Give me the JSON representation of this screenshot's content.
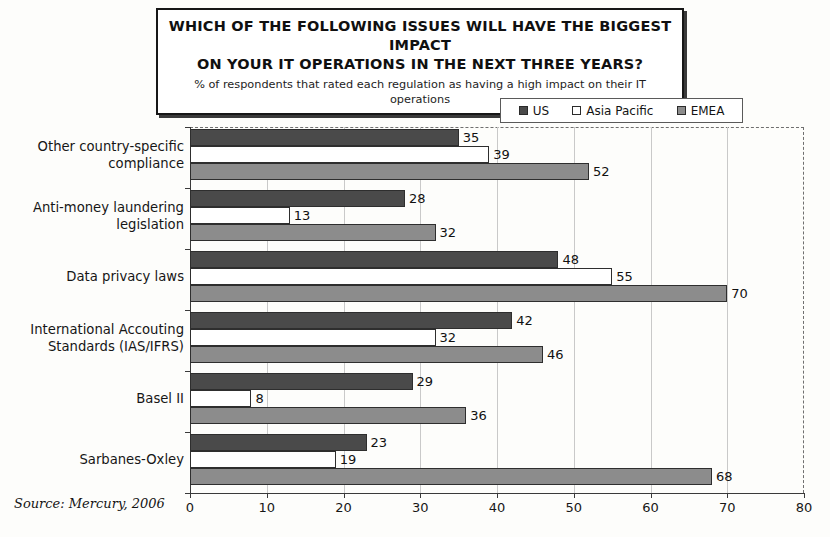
{
  "title": {
    "line1": "WHICH OF THE FOLLOWING ISSUES WILL HAVE THE BIGGEST IMPACT",
    "line2": "ON YOUR IT OPERATIONS IN THE NEXT THREE YEARS?",
    "subtitle": "% of respondents that rated each regulation as having a high impact on their IT operations"
  },
  "source": "Source: Mercury, 2006",
  "colors": {
    "us": "#4a4a4a",
    "asia_pacific": "#ffffff",
    "emea": "#8c8c8c",
    "grid": "#c9c9c9",
    "axis": "#3a3a3a",
    "frame_dashed": "#6f6f6f"
  },
  "chart_data": {
    "type": "bar",
    "orientation": "horizontal",
    "title": "WHICH OF THE FOLLOWING ISSUES WILL HAVE THE BIGGEST IMPACT ON YOUR IT OPERATIONS IN THE NEXT THREE YEARS?",
    "subtitle": "% of respondents that rated each regulation as having a high impact on their IT operations",
    "xlabel": "",
    "ylabel": "",
    "xlim": [
      0,
      80
    ],
    "xticks": [
      0,
      10,
      20,
      30,
      40,
      50,
      60,
      70,
      80
    ],
    "grid": true,
    "legend_position": "top-right",
    "categories": [
      "Other country-specific compliance",
      "Anti-money laundering legislation",
      "Data privacy laws",
      "International Accouting Standards (IAS/IFRS)",
      "Basel II",
      "Sarbanes-Oxley"
    ],
    "category_lines": [
      [
        "Other country-specific",
        "compliance"
      ],
      [
        "Anti-money laundering",
        "legislation"
      ],
      [
        "Data privacy laws"
      ],
      [
        "International Accouting",
        "Standards (IAS/IFRS)"
      ],
      [
        "Basel II"
      ],
      [
        "Sarbanes-Oxley"
      ]
    ],
    "series": [
      {
        "name": "US",
        "color": "#4a4a4a",
        "values": [
          35,
          28,
          48,
          42,
          29,
          23
        ]
      },
      {
        "name": "Asia Pacific",
        "color": "#ffffff",
        "values": [
          39,
          13,
          55,
          32,
          8,
          19
        ]
      },
      {
        "name": "EMEA",
        "color": "#8c8c8c",
        "values": [
          52,
          32,
          70,
          46,
          36,
          68
        ]
      }
    ]
  },
  "legend": {
    "items": [
      {
        "label": "US",
        "color": "#4a4a4a"
      },
      {
        "label": "Asia Pacific",
        "color": "#ffffff"
      },
      {
        "label": "EMEA",
        "color": "#8c8c8c"
      }
    ]
  }
}
